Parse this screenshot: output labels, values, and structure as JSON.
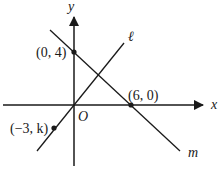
{
  "diagram": {
    "type": "coordinate-plane",
    "axes": {
      "x_label": "x",
      "y_label": "y",
      "origin_label": "O"
    },
    "lines": [
      {
        "name": "ℓ",
        "label": "ℓ",
        "passes_through": [
          "O",
          "(-3, k)"
        ]
      },
      {
        "name": "m",
        "label": "m",
        "passes_through": [
          "(0, 4)",
          "(6, 0)"
        ]
      }
    ],
    "points": [
      {
        "label": "(0, 4)",
        "on": "y-axis"
      },
      {
        "label": "(6, 0)",
        "on": "x-axis"
      },
      {
        "label": "(−3, k)",
        "on": "ℓ"
      }
    ],
    "colors": {
      "stroke": "#1a1a1a",
      "background": "#ffffff"
    }
  }
}
